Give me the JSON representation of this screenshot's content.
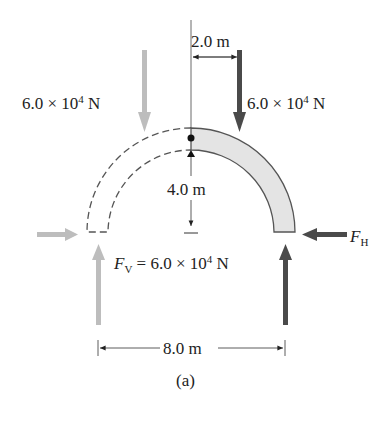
{
  "figure": {
    "caption": "(a)",
    "labels": {
      "left_load": {
        "mantissa": "6.0 × 10",
        "exp": "4",
        "unit": " N"
      },
      "right_load": {
        "mantissa": "6.0 × 10",
        "exp": "4",
        "unit": " N"
      },
      "dim_horizontal_top": "2.0 m",
      "dim_height": "4.0 m",
      "dim_span": "8.0 m",
      "fv": {
        "symbol": "F",
        "sub": "V",
        "eq": " = 6.0 × 10",
        "exp": "4",
        "unit": " N"
      },
      "fh": {
        "symbol": "F",
        "sub": "H"
      }
    },
    "colors": {
      "arch_fill": "#e4e4e4",
      "arch_stroke": "#555555",
      "dark_arrow": "#4a4a4a",
      "light_arrow": "#bdbdbd",
      "dashed": "#555555"
    }
  }
}
